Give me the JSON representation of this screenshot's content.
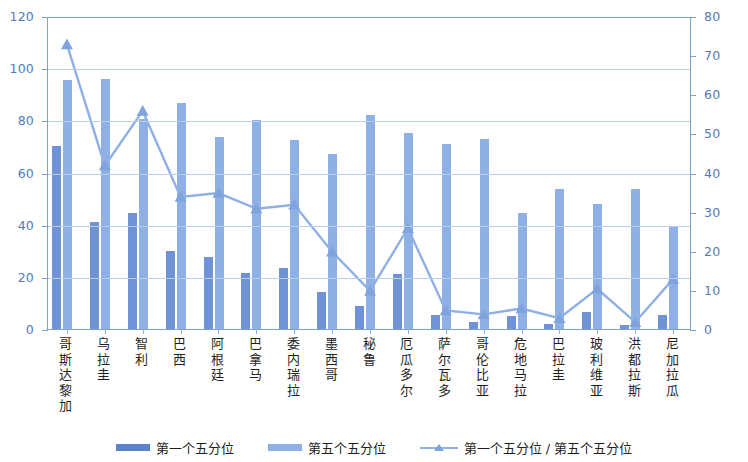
{
  "chart_data": {
    "type": "bar",
    "title": "",
    "subtitle": "",
    "xlabel": "",
    "ylabel": "",
    "y2label": "",
    "ylim": [
      0,
      120
    ],
    "y2lim": [
      0,
      80
    ],
    "yticks": [
      0,
      20,
      40,
      60,
      80,
      100,
      120
    ],
    "y2ticks": [
      0,
      10,
      20,
      30,
      40,
      50,
      60,
      70,
      80
    ],
    "grid": true,
    "legend_position": "bottom",
    "categories": [
      "哥斯达黎加",
      "乌拉圭",
      "智利",
      "巴西",
      "阿根廷",
      "巴拿马",
      "委内瑞拉",
      "墨西哥",
      "秘鲁",
      "厄瓜多尔",
      "萨尔瓦多",
      "哥伦比亚",
      "危地马拉",
      "巴拉圭",
      "玻利维亚",
      "洪都拉斯",
      "尼加拉瓜"
    ],
    "series": [
      {
        "name": "第一个五分位",
        "type": "bar",
        "axis": "left",
        "color": "#6f93d4",
        "values": [
          70,
          41,
          44.5,
          30,
          27.5,
          21.5,
          23.5,
          14,
          9,
          21,
          5.5,
          2.5,
          5,
          2,
          6.5,
          1.5,
          5.5
        ]
      },
      {
        "name": "第五个五分位",
        "type": "bar",
        "axis": "left",
        "color": "#8fb0e4",
        "values": [
          95.5,
          96,
          80.5,
          86.5,
          73.5,
          80,
          72.5,
          67,
          82,
          75,
          71,
          73,
          44.5,
          53.5,
          48,
          53.5,
          39.5
        ]
      },
      {
        "name": "第一个五分位 / 第五个五分位",
        "type": "line",
        "axis": "right",
        "color": "#8fb0e4",
        "marker": "triangle",
        "values": [
          73,
          42,
          56,
          34,
          35,
          31,
          32,
          20,
          10,
          26,
          5,
          4,
          5.5,
          3,
          10.5,
          2,
          13
        ]
      }
    ]
  },
  "legend": {
    "items": [
      {
        "label": "第一个五分位",
        "icon": "bar-swatch-dark"
      },
      {
        "label": "第五个五分位",
        "icon": "bar-swatch-light"
      },
      {
        "label": "第一个五分位 / 第五个五分位",
        "icon": "line-triangle-marker"
      }
    ]
  },
  "colors": {
    "bar_first_quintile": "#6f93d4",
    "bar_fifth_quintile": "#8fb0e4",
    "line": "#8fb0e4",
    "axis": "#7aa2d2",
    "gridline": "#b9cfe8",
    "axis_text": "#4f7cba",
    "label_text": "#1f1f1f"
  }
}
